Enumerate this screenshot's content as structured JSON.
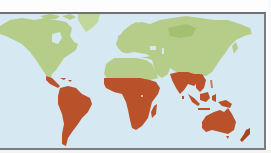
{
  "map": {
    "type": "world-choropleth",
    "projection": "equirectangular-like",
    "colors": {
      "ocean": "#d6e8f2",
      "land_default": "#b5cd88",
      "land_default_dark": "#a3c070",
      "land_highlight": "#b9512a",
      "land_highlight_dark": "#a9441f",
      "frame": "#6e7275",
      "background": "#ffffff"
    },
    "highlighted_regions": [
      "Central America",
      "South America",
      "Sub-Saharan Africa",
      "Madagascar",
      "South Asia (India)",
      "Southeast Asia",
      "Maritime Southeast Asia",
      "New Guinea",
      "Australia",
      "New Zealand"
    ],
    "default_regions": [
      "North America",
      "Greenland",
      "Europe",
      "North Africa",
      "Middle East",
      "Russia / Northern Asia",
      "China / East Asia"
    ],
    "labels": []
  }
}
